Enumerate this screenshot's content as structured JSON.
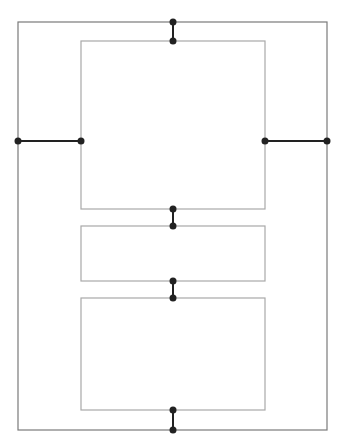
{
  "diagram": {
    "width": 346,
    "height": 445,
    "colors": {
      "outer_stroke": "#7a7a7a",
      "inner_stroke": "#a8a8a8",
      "connector": "#222222",
      "background": "#ffffff"
    },
    "outer_frame": {
      "x": 18,
      "y": 22,
      "w": 309,
      "h": 408
    },
    "boxes": [
      {
        "id": "top-box",
        "x": 81,
        "y": 41,
        "w": 184,
        "h": 168
      },
      {
        "id": "middle-box",
        "x": 81,
        "y": 226,
        "w": 184,
        "h": 55
      },
      {
        "id": "bottom-box",
        "x": 81,
        "y": 298,
        "w": 184,
        "h": 112
      }
    ],
    "connectors": [
      {
        "id": "top-connector",
        "x1": 173,
        "y1": 22,
        "x2": 173,
        "y2": 41
      },
      {
        "id": "left-connector",
        "x1": 18,
        "y1": 141,
        "x2": 81,
        "y2": 141
      },
      {
        "id": "right-connector",
        "x1": 265,
        "y1": 141,
        "x2": 327,
        "y2": 141
      },
      {
        "id": "top-middle-connector",
        "x1": 173,
        "y1": 209,
        "x2": 173,
        "y2": 226
      },
      {
        "id": "middle-bottom-connector",
        "x1": 173,
        "y1": 281,
        "x2": 173,
        "y2": 298
      },
      {
        "id": "bottom-connector",
        "x1": 173,
        "y1": 410,
        "x2": 173,
        "y2": 430
      }
    ]
  }
}
